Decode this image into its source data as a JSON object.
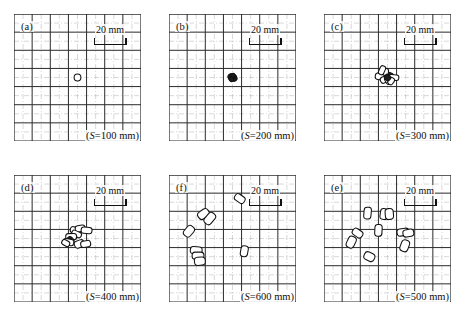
{
  "figure": {
    "panel_count": 6,
    "grid_cells": 7,
    "scale_text": "20 mm",
    "ink_color": "#1a1a1a",
    "grid_major_color": "#2b2b2b",
    "grid_minor_color": "#b9b9b9",
    "background": "#ffffff"
  },
  "chart_data": {
    "type": "scatter",
    "xlabel": "",
    "ylabel": "",
    "xlim": [
      -70,
      70
    ],
    "ylim": [
      -70,
      70
    ],
    "grid": true,
    "legend": "none",
    "units": "mm",
    "gridline_spacing_mm": 20,
    "scale_bar_mm": 20,
    "panels": [
      {
        "id": "a",
        "letter": "(a)",
        "caption_prefix": "(S",
        "caption_eq": "=",
        "caption_value": "100 mm)",
        "caption": "(S=100 mm)",
        "S_mm": 100,
        "marker_count": 1,
        "description": "single small open circle at centre",
        "markers": [
          {
            "x": 0,
            "y": 0,
            "w": 7.5,
            "h": 7.5,
            "angle": 0,
            "shape": "circle",
            "fill": "none"
          }
        ]
      },
      {
        "id": "b",
        "letter": "(b)",
        "caption_prefix": "(S",
        "caption_eq": "=",
        "caption_value": "200 mm)",
        "caption": "(S=200 mm)",
        "S_mm": 200,
        "marker_count": 5,
        "description": "tight dark overlapping cluster at centre",
        "markers": [
          {
            "x": 0,
            "y": 0,
            "w": 9,
            "h": 8,
            "angle": 0,
            "shape": "blob",
            "fill": "dark"
          },
          {
            "x": -2,
            "y": 1,
            "w": 6,
            "h": 6,
            "angle": 35,
            "shape": "blob",
            "fill": "dark"
          },
          {
            "x": 2,
            "y": -1,
            "w": 6,
            "h": 6,
            "angle": -30,
            "shape": "blob",
            "fill": "dark"
          },
          {
            "x": 0.5,
            "y": 2,
            "w": 5,
            "h": 5,
            "angle": 70,
            "shape": "blob",
            "fill": "dark"
          },
          {
            "x": -1,
            "y": -2,
            "w": 5,
            "h": 5,
            "angle": 110,
            "shape": "blob",
            "fill": "dark"
          }
        ]
      },
      {
        "id": "c",
        "letter": "(c)",
        "caption_prefix": "(S",
        "caption_eq": "=",
        "caption_value": "300 mm)",
        "caption": "(S=300 mm)",
        "S_mm": 300,
        "marker_count": 9,
        "description": "dense cluster of overlapping capsules near centre",
        "markers": [
          {
            "x": -8,
            "y": 1,
            "w": 11,
            "h": 7,
            "angle": 8,
            "shape": "capsule",
            "fill": "none"
          },
          {
            "x": -3,
            "y": -2,
            "w": 10,
            "h": 7,
            "angle": -25,
            "shape": "capsule",
            "fill": "none"
          },
          {
            "x": 1,
            "y": -3,
            "w": 9,
            "h": 7,
            "angle": 60,
            "shape": "capsule",
            "fill": "none"
          },
          {
            "x": 2,
            "y": 2,
            "w": 9,
            "h": 7,
            "angle": 20,
            "shape": "capsule",
            "fill": "dark"
          },
          {
            "x": 7,
            "y": 0,
            "w": 11,
            "h": 6,
            "angle": 5,
            "shape": "capsule",
            "fill": "none"
          },
          {
            "x": 4,
            "y": -4,
            "w": 8,
            "h": 6,
            "angle": -55,
            "shape": "capsule",
            "fill": "none"
          },
          {
            "x": -2,
            "y": 6,
            "w": 8,
            "h": 6,
            "angle": 95,
            "shape": "capsule",
            "fill": "none"
          },
          {
            "x": -6,
            "y": 8,
            "w": 10,
            "h": 6,
            "angle": 115,
            "shape": "capsule",
            "fill": "none"
          },
          {
            "x": 0,
            "y": 0,
            "w": 7,
            "h": 6,
            "angle": 45,
            "shape": "capsule",
            "fill": "dark"
          }
        ]
      },
      {
        "id": "d",
        "letter": "(d)",
        "caption_prefix": "(S",
        "caption_eq": "=",
        "caption_value": "400 mm)",
        "caption": "(S=400 mm)",
        "S_mm": 400,
        "marker_count": 10,
        "description": "loosely spread capsules around centre-left",
        "markers": [
          {
            "x": -2,
            "y": 9,
            "w": 12,
            "h": 7,
            "angle": 12,
            "shape": "capsule",
            "fill": "none"
          },
          {
            "x": 3,
            "y": 11,
            "w": 11,
            "h": 7,
            "angle": -8,
            "shape": "capsule",
            "fill": "none"
          },
          {
            "x": 10,
            "y": 9,
            "w": 12,
            "h": 7,
            "angle": 5,
            "shape": "capsule",
            "fill": "none"
          },
          {
            "x": -1,
            "y": 5,
            "w": 11,
            "h": 6,
            "angle": 25,
            "shape": "capsule",
            "fill": "none"
          },
          {
            "x": -7,
            "y": 2,
            "w": 7,
            "h": 12,
            "angle": 88,
            "shape": "capsule",
            "fill": "none"
          },
          {
            "x": -8,
            "y": -2,
            "w": 8,
            "h": 7,
            "angle": 45,
            "shape": "capsule",
            "fill": "dark"
          },
          {
            "x": -10,
            "y": -4,
            "w": 12,
            "h": 7,
            "angle": 10,
            "shape": "capsule",
            "fill": "none"
          },
          {
            "x": -13,
            "y": -5,
            "w": 9,
            "h": 6,
            "angle": 30,
            "shape": "capsule",
            "fill": "none"
          },
          {
            "x": 2,
            "y": -6,
            "w": 8,
            "h": 11,
            "angle": 70,
            "shape": "capsule",
            "fill": "none"
          },
          {
            "x": 9,
            "y": -6,
            "w": 7,
            "h": 11,
            "angle": 80,
            "shape": "capsule",
            "fill": "none"
          }
        ]
      },
      {
        "id": "f",
        "letter": "(f)",
        "caption_prefix": "(S",
        "caption_eq": "=",
        "caption_value": "600 mm)",
        "caption": "(S=600 mm)",
        "S_mm": 600,
        "marker_count": 8,
        "description": "widely scattered capsules, mostly left and upper-centre",
        "markers": [
          {
            "x": 8,
            "y": 44,
            "w": 12,
            "h": 8,
            "angle": 35,
            "shape": "capsule",
            "fill": "none"
          },
          {
            "x": -32,
            "y": 27,
            "w": 9,
            "h": 13,
            "angle": 55,
            "shape": "capsule",
            "fill": "none"
          },
          {
            "x": -25,
            "y": 22,
            "w": 9,
            "h": 14,
            "angle": 40,
            "shape": "capsule",
            "fill": "none"
          },
          {
            "x": -48,
            "y": 8,
            "w": 9,
            "h": 13,
            "angle": 40,
            "shape": "capsule",
            "fill": "none"
          },
          {
            "x": -40,
            "y": -13,
            "w": 13,
            "h": 8,
            "angle": 5,
            "shape": "capsule",
            "fill": "none"
          },
          {
            "x": -38,
            "y": -19,
            "w": 13,
            "h": 8,
            "angle": 0,
            "shape": "capsule",
            "fill": "none"
          },
          {
            "x": -36,
            "y": -25,
            "w": 12,
            "h": 9,
            "angle": -5,
            "shape": "capsule",
            "fill": "none"
          },
          {
            "x": 13,
            "y": -14,
            "w": 8,
            "h": 12,
            "angle": 10,
            "shape": "capsule",
            "fill": "none"
          }
        ]
      },
      {
        "id": "e",
        "letter": "(e)",
        "caption_prefix": "(S",
        "caption_eq": "=",
        "caption_value": "500 mm)",
        "caption": "(S=500 mm)",
        "S_mm": 500,
        "marker_count": 10,
        "description": "broad scatter of capsules across the field",
        "markers": [
          {
            "x": -22,
            "y": 28,
            "w": 8,
            "h": 13,
            "angle": 5,
            "shape": "capsule",
            "fill": "none"
          },
          {
            "x": -4,
            "y": 27,
            "w": 8,
            "h": 12,
            "angle": 8,
            "shape": "capsule",
            "fill": "none"
          },
          {
            "x": 2,
            "y": 27,
            "w": 9,
            "h": 12,
            "angle": -5,
            "shape": "capsule",
            "fill": "none"
          },
          {
            "x": -10,
            "y": 9,
            "w": 8,
            "h": 13,
            "angle": 3,
            "shape": "capsule",
            "fill": "none"
          },
          {
            "x": -33,
            "y": 6,
            "w": 12,
            "h": 8,
            "angle": 35,
            "shape": "capsule",
            "fill": "none"
          },
          {
            "x": -40,
            "y": -4,
            "w": 9,
            "h": 13,
            "angle": 25,
            "shape": "capsule",
            "fill": "none"
          },
          {
            "x": 17,
            "y": 7,
            "w": 13,
            "h": 8,
            "angle": -8,
            "shape": "capsule",
            "fill": "none"
          },
          {
            "x": 23,
            "y": 6,
            "w": 12,
            "h": 8,
            "angle": -10,
            "shape": "capsule",
            "fill": "none"
          },
          {
            "x": 19,
            "y": -8,
            "w": 9,
            "h": 13,
            "angle": 20,
            "shape": "capsule",
            "fill": "none"
          },
          {
            "x": -20,
            "y": -20,
            "w": 12,
            "h": 9,
            "angle": 25,
            "shape": "capsule",
            "fill": "none"
          }
        ]
      }
    ]
  }
}
